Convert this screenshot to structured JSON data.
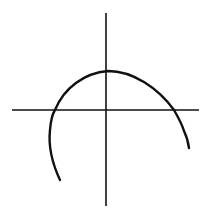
{
  "diagram": {
    "type": "coordinate-axes-with-arc",
    "width": 209,
    "height": 218,
    "background": "#ffffff",
    "stroke_color": "#111111",
    "axes": {
      "vertical": {
        "x1": 106,
        "y1": 13,
        "x2": 106,
        "y2": 206,
        "stroke_width": 1.6
      },
      "horizontal": {
        "x1": 12,
        "y1": 110,
        "x2": 199,
        "y2": 110,
        "stroke_width": 1.6
      }
    },
    "curve": {
      "stroke_width": 2.4,
      "path": "M 60 180 C 53 165, 48 148, 50 130 C 51 118, 53 113, 55 110 C 64 88, 84 73, 108 71 C 133 71, 158 88, 174 110 C 178 117, 182 124, 184 131 C 187 137, 188 141, 189 148"
    }
  }
}
